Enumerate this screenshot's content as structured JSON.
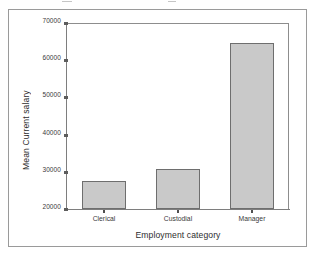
{
  "chart_data": {
    "type": "bar",
    "title": "",
    "subtitle": "",
    "categories": [
      "Clerical",
      "Custodial",
      "Manager"
    ],
    "values": [
      27500,
      30750,
      64600
    ],
    "series": [
      {
        "name": "Mean Current salary",
        "values": [
          27500,
          30750,
          64600
        ]
      }
    ],
    "xlabel": "Employment category",
    "ylabel": "Mean Current salary",
    "ylim": [
      20000,
      70000
    ],
    "yticks": [
      20000,
      30000,
      40000,
      50000,
      60000,
      70000
    ],
    "ytick_labels": [
      "20000",
      "30000",
      "40000",
      "50000",
      "60000",
      "70000"
    ],
    "grid": false,
    "legend": null,
    "legend_position": "none",
    "bar_fill_color": "#c9c9c9",
    "bar_border_color": "#6e6e6e",
    "axis_color": "#7e7e7e",
    "plot_background": "#ffffff",
    "frame_border_color": "#9a9a9a",
    "annotations": []
  },
  "axes": {
    "y_title": "Mean Current salary",
    "x_title": "Employment category"
  },
  "ticks": {
    "y": [
      {
        "label": "70000",
        "value": 70000
      },
      {
        "label": "60000",
        "value": 60000
      },
      {
        "label": "50000",
        "value": 50000
      },
      {
        "label": "40000",
        "value": 40000
      },
      {
        "label": "30000",
        "value": 30000
      },
      {
        "label": "20000",
        "value": 20000
      }
    ],
    "x": [
      {
        "label": "Clerical"
      },
      {
        "label": "Custodial"
      },
      {
        "label": "Manager"
      }
    ]
  },
  "bars": [
    {
      "category": "Clerical",
      "value": 27500
    },
    {
      "category": "Custodial",
      "value": 30750
    },
    {
      "category": "Manager",
      "value": 64600
    }
  ]
}
